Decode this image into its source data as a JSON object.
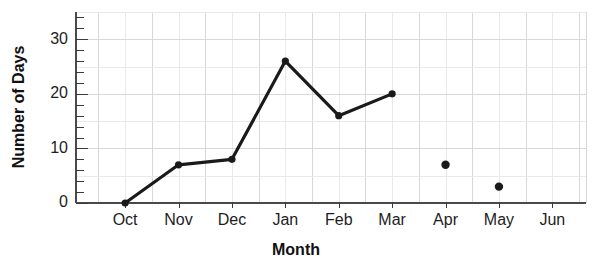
{
  "chart_data": {
    "type": "line",
    "title": "",
    "subtitle": "",
    "xlabel": "Month",
    "ylabel": "Number of Days",
    "categories": [
      "Oct",
      "Nov",
      "Dec",
      "Jan",
      "Feb",
      "Mar",
      "Apr",
      "May",
      "Jun"
    ],
    "series": [
      {
        "name": "Number of Days",
        "values": [
          0,
          7,
          8,
          26,
          16,
          20,
          7,
          3,
          null
        ],
        "connected_through_index": 5,
        "marker": "circle",
        "color": "#1a1a1a"
      }
    ],
    "points": [
      {
        "x": "Oct",
        "y": 0,
        "connected": true
      },
      {
        "x": "Nov",
        "y": 7,
        "connected": true
      },
      {
        "x": "Dec",
        "y": 8,
        "connected": true
      },
      {
        "x": "Jan",
        "y": 26,
        "connected": true
      },
      {
        "x": "Feb",
        "y": 16,
        "connected": true
      },
      {
        "x": "Mar",
        "y": 20,
        "connected": true
      },
      {
        "x": "Apr",
        "y": 7,
        "connected": false
      },
      {
        "x": "May",
        "y": 3,
        "connected": false
      }
    ],
    "ylim": [
      0,
      35
    ],
    "y_ticks_major": [
      0,
      10,
      20,
      30
    ],
    "y_tick_labels": [
      "0",
      "10",
      "20",
      "30"
    ],
    "y_minor_tick_step": 2,
    "y_gridline_step": 5,
    "grid": true,
    "grid_color": "#e9e9ec",
    "legend": "none",
    "axis_color": "#4a4a4a"
  },
  "axes": {
    "y_title": "Number of Days",
    "x_title": "Month"
  },
  "colors": {
    "line": "#1a1a1a",
    "grid": "#e9e9ec",
    "grid_major": "#d8d8dc",
    "axis": "#4a4a4a",
    "text": "#1d1d1d",
    "background": "#ffffff"
  }
}
